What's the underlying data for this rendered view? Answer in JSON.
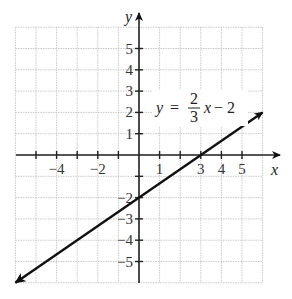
{
  "chart_data": {
    "type": "line",
    "title": "",
    "xlabel": "x",
    "ylabel": "y",
    "xlim": [
      -6,
      6
    ],
    "ylim": [
      -6,
      6
    ],
    "grid": true,
    "x_tick_labels": [
      "-4",
      "-2",
      "1",
      "3",
      "4",
      "5"
    ],
    "y_tick_labels": [
      "5",
      "4",
      "3",
      "2",
      "1",
      "-2",
      "-3",
      "-4",
      "-5"
    ],
    "series": [
      {
        "name": "y = 2/3 x - 2",
        "equation": "y = (2/3)x - 2",
        "slope": 0.6667,
        "intercept": -2,
        "x": [
          -6,
          0,
          3,
          6
        ],
        "y": [
          -6,
          -2,
          0,
          2
        ],
        "arrows_both_ends": true
      }
    ],
    "annotations": [
      {
        "text": "y = 2/3 x − 2",
        "lhs": "y",
        "eq": "=",
        "num": "2",
        "den": "3",
        "var": "x",
        "rest": "− 2"
      }
    ]
  },
  "labels": {
    "x_axis": "x",
    "y_axis": "y",
    "x_ticks": [
      {
        "value": -4,
        "text": "−4"
      },
      {
        "value": -2,
        "text": "−2"
      },
      {
        "value": 1,
        "text": "1"
      },
      {
        "value": 3,
        "text": "3"
      },
      {
        "value": 4,
        "text": "4"
      },
      {
        "value": 5,
        "text": "5"
      }
    ],
    "y_ticks": [
      {
        "value": 5,
        "text": "5"
      },
      {
        "value": 4,
        "text": "4"
      },
      {
        "value": 3,
        "text": "3"
      },
      {
        "value": 2,
        "text": "2"
      },
      {
        "value": 1,
        "text": "1"
      },
      {
        "value": -2,
        "text": "−2"
      },
      {
        "value": -3,
        "text": "−3"
      },
      {
        "value": -4,
        "text": "−4"
      },
      {
        "value": -5,
        "text": "−5"
      }
    ],
    "equation": {
      "lhs": "y",
      "eq": "=",
      "num": "2",
      "den": "3",
      "var": "x",
      "rest": "− 2"
    }
  }
}
